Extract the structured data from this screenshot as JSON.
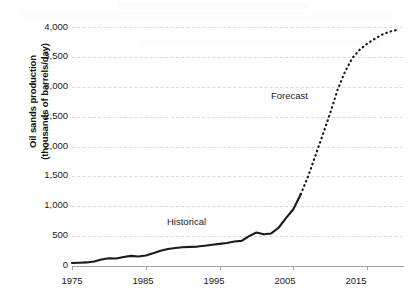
{
  "chart_data": {
    "type": "line",
    "title": "",
    "subtitle": "",
    "xlabel": "",
    "ylabel": "Oil sands production (thousands of barrels/day)",
    "ylabel_line1": "Oil sands production",
    "ylabel_line2": "(thousands of barrels/day)",
    "xlim": [
      1975,
      2020
    ],
    "ylim": [
      0,
      4000
    ],
    "grid": true,
    "grid_axis": "y",
    "legend_position": "inline-annotations",
    "y_ticks": [
      0,
      500,
      1000,
      1500,
      2000,
      2500,
      3000,
      3500,
      4000
    ],
    "y_tick_labels": [
      "0",
      "500",
      "1,000",
      "1,500",
      "2,000",
      "2,500",
      "3,000",
      "3,500",
      "4,000"
    ],
    "x_ticks": [
      1975,
      1985,
      1995,
      2005,
      2015
    ],
    "x_tick_labels": [
      "1975",
      "1985",
      "1995",
      "2005",
      "2015"
    ],
    "annotations": [
      {
        "text": "Historical",
        "x": 1989,
        "y": 760
      },
      {
        "text": "Forecast",
        "x": 2008,
        "y": 2720
      }
    ],
    "series": [
      {
        "name": "Historical",
        "style": "solid",
        "color": "#1a1a1a",
        "x": [
          1975,
          1976,
          1977,
          1978,
          1979,
          1980,
          1981,
          1982,
          1983,
          1984,
          1985,
          1986,
          1987,
          1988,
          1989,
          1990,
          1991,
          1992,
          1993,
          1994,
          1995,
          1996,
          1997,
          1998,
          1999,
          2000,
          2001,
          2002,
          2003,
          2004,
          2005,
          2006
        ],
        "y": [
          50,
          55,
          60,
          75,
          110,
          130,
          125,
          150,
          170,
          160,
          175,
          215,
          255,
          285,
          300,
          315,
          320,
          325,
          340,
          355,
          370,
          385,
          410,
          420,
          500,
          560,
          530,
          545,
          640,
          800,
          950,
          1200
        ]
      },
      {
        "name": "Forecast",
        "style": "dotted",
        "color": "#1a1a1a",
        "x": [
          2006,
          2007,
          2008,
          2009,
          2010,
          2011,
          2012,
          2013,
          2014,
          2015,
          2016,
          2017,
          2018,
          2019
        ],
        "y": [
          1200,
          1500,
          1850,
          2200,
          2560,
          2950,
          3250,
          3480,
          3620,
          3720,
          3800,
          3870,
          3920,
          3950
        ]
      }
    ]
  },
  "axis": {
    "axis_line_color": "#999999",
    "grid_line_color": "#cfcfcf",
    "series_color": "#1a1a1a"
  }
}
